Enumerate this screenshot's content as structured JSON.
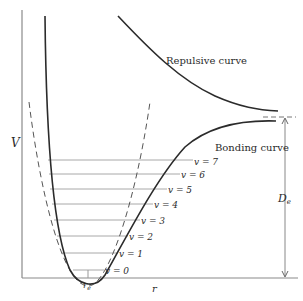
{
  "diagram": {
    "type": "potential-energy-curve",
    "axes": {
      "y_label": "V",
      "x_label": "r",
      "x_tick_label": "r",
      "x_tick_subscript": "e"
    },
    "curves": {
      "repulsive_label": "Repulsive curve",
      "bonding_label": "Bonding curve"
    },
    "dissociation": {
      "label": "D",
      "label_subscript": "e"
    },
    "levels": [
      {
        "label": "v = 7",
        "y": 160
      },
      {
        "label": "v = 6",
        "y": 174
      },
      {
        "label": "v = 5",
        "y": 189
      },
      {
        "label": "v = 4",
        "y": 204
      },
      {
        "label": "v = 3",
        "y": 220
      },
      {
        "label": "v = 2",
        "y": 236
      },
      {
        "label": "v = 1",
        "y": 253
      },
      {
        "label": "v = 0",
        "y": 270
      }
    ],
    "colors": {
      "curve": "#2b2b2b",
      "level_line": "#9a9a9a",
      "axis": "#8a8a8a"
    }
  }
}
